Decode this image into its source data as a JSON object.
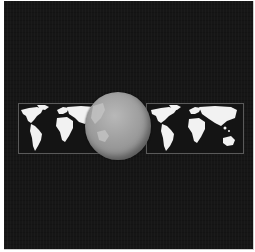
{
  "scene": {
    "description": "Gray globe in front of a horizontal strip of two white world maps on a dark background",
    "background_color": "#161616",
    "map_land_color": "#f2f2f2",
    "map_frame_color": "#5a5a5a",
    "globe_color": "#9e9e9e"
  },
  "elements": {
    "left_map": "world-map",
    "right_map": "world-map",
    "globe": "globe"
  }
}
